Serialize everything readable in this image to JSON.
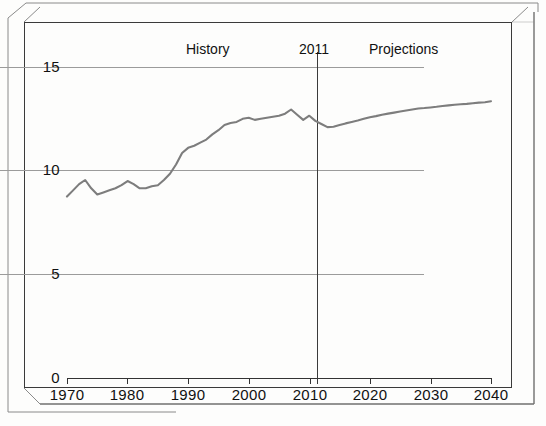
{
  "figure": {
    "background_color": "#fdfdfc",
    "frame_color": "#3a3a3a",
    "series_color": "#7d7d7d",
    "grid_color": "#9b9b9b",
    "text_color": "#111111"
  },
  "annotations": {
    "history": "History",
    "divider_year": "2011",
    "projections": "Projections"
  },
  "chart_data": {
    "type": "line",
    "title": "",
    "xlabel": "",
    "ylabel": "",
    "xlim": [
      1970,
      2040
    ],
    "ylim": [
      0,
      15
    ],
    "xticks": [
      1970,
      1980,
      1990,
      2000,
      2010,
      2020,
      2030,
      2040
    ],
    "yticks": [
      0,
      5,
      10,
      15
    ],
    "xtick_labels": [
      "1970",
      "1980",
      "1990",
      "2000",
      "2010",
      "2020",
      "2030",
      "2040"
    ],
    "ytick_labels": [
      "0",
      "5",
      "10",
      "15"
    ],
    "grid": "horizontal",
    "legend": "none",
    "annotations": [
      {
        "text": "History",
        "x": 1989,
        "y": 15.6
      },
      {
        "text": "2011",
        "x": 2009,
        "y": 15.6
      },
      {
        "text": "Projections",
        "x": 2024,
        "y": 15.6
      }
    ],
    "vertical_marker": {
      "x": 2011,
      "label": "2011"
    },
    "series": [
      {
        "name": "Total consumption",
        "color": "#7d7d7d",
        "x": [
          1970,
          1971,
          1972,
          1973,
          1974,
          1975,
          1976,
          1977,
          1978,
          1979,
          1980,
          1981,
          1982,
          1983,
          1984,
          1985,
          1986,
          1987,
          1988,
          1989,
          1990,
          1991,
          1992,
          1993,
          1994,
          1995,
          1996,
          1997,
          1998,
          1999,
          2000,
          2001,
          2002,
          2003,
          2004,
          2005,
          2006,
          2007,
          2008,
          2009,
          2010,
          2011,
          2012,
          2013,
          2014,
          2015,
          2016,
          2017,
          2018,
          2019,
          2020,
          2021,
          2022,
          2023,
          2024,
          2025,
          2026,
          2027,
          2028,
          2029,
          2030,
          2031,
          2032,
          2033,
          2034,
          2035,
          2036,
          2037,
          2038,
          2039,
          2040
        ],
        "y": [
          8.75,
          9.05,
          9.35,
          9.55,
          9.15,
          8.85,
          8.95,
          9.05,
          9.15,
          9.3,
          9.5,
          9.35,
          9.15,
          9.15,
          9.25,
          9.3,
          9.55,
          9.85,
          10.3,
          10.85,
          11.1,
          11.2,
          11.35,
          11.5,
          11.75,
          11.95,
          12.2,
          12.3,
          12.35,
          12.5,
          12.55,
          12.45,
          12.5,
          12.55,
          12.6,
          12.65,
          12.75,
          12.95,
          12.7,
          12.45,
          12.65,
          12.4,
          12.25,
          12.1,
          12.12,
          12.2,
          12.28,
          12.35,
          12.42,
          12.5,
          12.58,
          12.63,
          12.7,
          12.75,
          12.8,
          12.85,
          12.9,
          12.95,
          13.0,
          13.02,
          13.05,
          13.08,
          13.12,
          13.15,
          13.18,
          13.2,
          13.22,
          13.25,
          13.28,
          13.3,
          13.35
        ]
      }
    ]
  }
}
